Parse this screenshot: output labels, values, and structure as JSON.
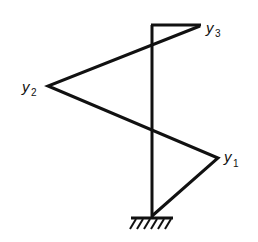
{
  "diagram": {
    "type": "mode-shape",
    "colors": {
      "line": "#111111",
      "background": "#ffffff"
    },
    "labels": [
      {
        "id": "y3",
        "base": "y",
        "sub": "3"
      },
      {
        "id": "y2",
        "base": "y",
        "sub": "2"
      },
      {
        "id": "y1",
        "base": "y",
        "sub": "1"
      }
    ],
    "support": "fixed-base"
  }
}
